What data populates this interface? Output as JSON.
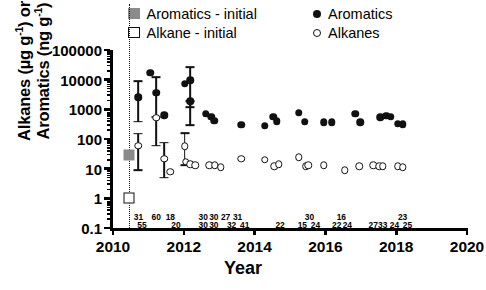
{
  "chart_data": {
    "type": "scatter",
    "title": "",
    "xlabel": "Year",
    "ylabel_line1": "Alkanes (µg g",
    "ylabel_line1_sup": "-1",
    "ylabel_line1_tail": ") or",
    "ylabel_line2": "Aromatics (ng g",
    "ylabel_line2_sup": "-1",
    "ylabel_line2_tail": ")",
    "xlim": [
      2010,
      2020
    ],
    "ylim": [
      0.1,
      100000
    ],
    "yscale": "log",
    "xticks": [
      2010,
      2012,
      2014,
      2016,
      2018,
      2020
    ],
    "xtick_labels": [
      "2010",
      "2012",
      "2014",
      "2016",
      "2018",
      "2020"
    ],
    "yticks": [
      0.1,
      1,
      10,
      100,
      1000,
      10000,
      100000
    ],
    "ytick_labels": [
      "0.1",
      "1",
      "10",
      "100",
      "1000",
      "10000",
      "100000"
    ],
    "grid": false,
    "legend_position": "top",
    "spill_reference_year": 2010.45,
    "series": [
      {
        "name": "Aromatics - initial",
        "marker": "filled-square",
        "color": "#8a8a8a",
        "points": [
          {
            "x": 2010.45,
            "y": 30
          }
        ]
      },
      {
        "name": "Alkane - initial",
        "marker": "open-square",
        "color": "#ffffff",
        "points": [
          {
            "x": 2010.45,
            "y": 1.05
          }
        ]
      },
      {
        "name": "Aromatics",
        "marker": "filled-circle",
        "color": "#111111",
        "points": [
          {
            "x": 2010.72,
            "y": 2600,
            "yerr_low": 380,
            "yerr_high": 9000
          },
          {
            "x": 2011.05,
            "y": 17000
          },
          {
            "x": 2011.22,
            "y": 3600,
            "yerr_low": 560,
            "yerr_high": 12000
          },
          {
            "x": 2011.45,
            "y": 620
          },
          {
            "x": 2012.02,
            "y": 7200
          },
          {
            "x": 2012.18,
            "y": 9500,
            "yerr_low": 1200,
            "yerr_high": 26000
          },
          {
            "x": 2012.18,
            "y": 1900,
            "yerr_low": 300,
            "yerr_high": 1900
          },
          {
            "x": 2012.62,
            "y": 700
          },
          {
            "x": 2012.78,
            "y": 560
          },
          {
            "x": 2012.86,
            "y": 420
          },
          {
            "x": 2013.62,
            "y": 300
          },
          {
            "x": 2014.28,
            "y": 280
          },
          {
            "x": 2014.52,
            "y": 560
          },
          {
            "x": 2014.62,
            "y": 400
          },
          {
            "x": 2015.25,
            "y": 780
          },
          {
            "x": 2015.42,
            "y": 380
          },
          {
            "x": 2015.95,
            "y": 370
          },
          {
            "x": 2016.18,
            "y": 360
          },
          {
            "x": 2016.85,
            "y": 700
          },
          {
            "x": 2016.98,
            "y": 360
          },
          {
            "x": 2017.55,
            "y": 540
          },
          {
            "x": 2017.72,
            "y": 600
          },
          {
            "x": 2017.85,
            "y": 560
          },
          {
            "x": 2018.05,
            "y": 330
          },
          {
            "x": 2018.18,
            "y": 310
          }
        ]
      },
      {
        "name": "Alkanes",
        "marker": "open-circle",
        "color": "#ffffff",
        "points": [
          {
            "x": 2010.72,
            "y": 60,
            "yerr_low": 9,
            "yerr_high": 150
          },
          {
            "x": 2011.22,
            "y": 530,
            "yerr_low": 60,
            "yerr_high": 530
          },
          {
            "x": 2011.45,
            "y": 22,
            "yerr_low": 5,
            "yerr_high": 75
          },
          {
            "x": 2011.62,
            "y": 8
          },
          {
            "x": 2012.02,
            "y": 58,
            "yerr_low": 13,
            "yerr_high": 160
          },
          {
            "x": 2012.05,
            "y": 17
          },
          {
            "x": 2012.18,
            "y": 14
          },
          {
            "x": 2012.32,
            "y": 13
          },
          {
            "x": 2012.72,
            "y": 13
          },
          {
            "x": 2012.88,
            "y": 13
          },
          {
            "x": 2013.05,
            "y": 11
          },
          {
            "x": 2013.62,
            "y": 22
          },
          {
            "x": 2014.28,
            "y": 20
          },
          {
            "x": 2014.55,
            "y": 12
          },
          {
            "x": 2014.68,
            "y": 14
          },
          {
            "x": 2015.25,
            "y": 24
          },
          {
            "x": 2015.45,
            "y": 12
          },
          {
            "x": 2015.52,
            "y": 13
          },
          {
            "x": 2015.95,
            "y": 13
          },
          {
            "x": 2016.55,
            "y": 9
          },
          {
            "x": 2016.95,
            "y": 12
          },
          {
            "x": 2017.35,
            "y": 13
          },
          {
            "x": 2017.52,
            "y": 12
          },
          {
            "x": 2017.62,
            "y": 12
          },
          {
            "x": 2018.05,
            "y": 12
          },
          {
            "x": 2018.18,
            "y": 11
          }
        ]
      }
    ],
    "sample_counts_upper": [
      {
        "x": 2010.72,
        "label": "31"
      },
      {
        "x": 2011.22,
        "label": "60"
      },
      {
        "x": 2011.62,
        "label": "18"
      },
      {
        "x": 2012.55,
        "label": "30"
      },
      {
        "x": 2012.85,
        "label": "30"
      },
      {
        "x": 2013.18,
        "label": "27"
      },
      {
        "x": 2013.52,
        "label": "31"
      },
      {
        "x": 2015.55,
        "label": "30"
      },
      {
        "x": 2016.45,
        "label": "16"
      },
      {
        "x": 2018.18,
        "label": "23"
      }
    ],
    "sample_counts_lower": [
      {
        "x": 2010.82,
        "label": "55"
      },
      {
        "x": 2011.78,
        "label": "20"
      },
      {
        "x": 2012.55,
        "label": "30"
      },
      {
        "x": 2012.85,
        "label": "30"
      },
      {
        "x": 2013.35,
        "label": "32"
      },
      {
        "x": 2013.72,
        "label": "41"
      },
      {
        "x": 2014.72,
        "label": "22"
      },
      {
        "x": 2015.35,
        "label": "15"
      },
      {
        "x": 2015.72,
        "label": "24"
      },
      {
        "x": 2016.32,
        "label": "22"
      },
      {
        "x": 2016.62,
        "label": "24"
      },
      {
        "x": 2017.35,
        "label": "27"
      },
      {
        "x": 2017.62,
        "label": "33"
      },
      {
        "x": 2017.95,
        "label": "24"
      },
      {
        "x": 2018.32,
        "label": "25"
      }
    ]
  },
  "legend": {
    "items": [
      {
        "label": "Aromatics - initial",
        "marker": "filled-square"
      },
      {
        "label": "Alkane - initial",
        "marker": "open-square"
      },
      {
        "label": "Aromatics",
        "marker": "filled-circle"
      },
      {
        "label": "Alkanes",
        "marker": "open-circle"
      }
    ]
  }
}
